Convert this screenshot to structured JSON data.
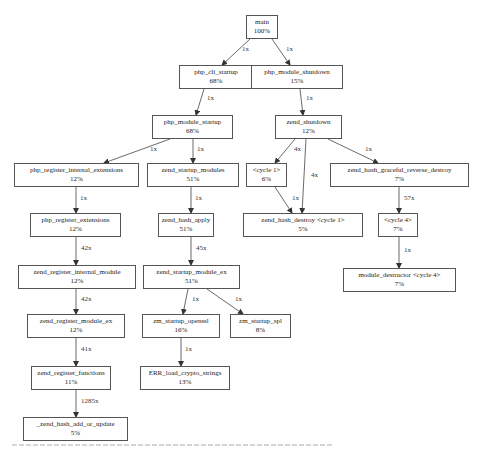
{
  "nodes": [
    {
      "id": "main",
      "name": "main",
      "pct": "100%",
      "x": 246,
      "y": 15,
      "w": 32,
      "h": 24
    },
    {
      "id": "php_cli_startup",
      "name": "php_cli_startup",
      "pct": "68%",
      "x": 179,
      "y": 65,
      "w": 74,
      "h": 24
    },
    {
      "id": "php_module_shutdown",
      "name": "php_module_shutdown",
      "pct": "15%",
      "x": 251,
      "y": 65,
      "w": 92,
      "h": 24
    },
    {
      "id": "php_module_startup",
      "name": "php_module_startup",
      "pct": "68%",
      "x": 152,
      "y": 115,
      "w": 81,
      "h": 24
    },
    {
      "id": "zend_shutdown",
      "name": "zend_shutdown",
      "pct": "12%",
      "x": 275,
      "y": 115,
      "w": 67,
      "h": 24
    },
    {
      "id": "php_register_internal_extensions",
      "name": "php_register_internal_extensions",
      "pct": "12%",
      "x": 14,
      "y": 163,
      "w": 125,
      "h": 24
    },
    {
      "id": "zend_startup_modules",
      "name": "zend_startup_modules",
      "pct": "51%",
      "x": 147,
      "y": 163,
      "w": 92,
      "h": 24
    },
    {
      "id": "cycle1",
      "name": "<cycle 1>",
      "pct": "6%",
      "x": 246,
      "y": 163,
      "w": 41,
      "h": 24
    },
    {
      "id": "zend_hash_graceful_reverse_destroy",
      "name": "zend_hash_graceful_reverse_destroy",
      "pct": "7%",
      "x": 330,
      "y": 163,
      "w": 139,
      "h": 24
    },
    {
      "id": "php_register_extensions",
      "name": "php_register_extensions",
      "pct": "12%",
      "x": 30,
      "y": 213,
      "w": 91,
      "h": 24
    },
    {
      "id": "zend_hash_apply",
      "name": "zend_hash_apply",
      "pct": "51%",
      "x": 158,
      "y": 213,
      "w": 56,
      "h": 24
    },
    {
      "id": "zend_hash_destroy",
      "name": "zend_hash_destroy <cycle 1>",
      "pct": "5%",
      "x": 243,
      "y": 213,
      "w": 120,
      "h": 24
    },
    {
      "id": "cycle4",
      "name": "<cycle 4>",
      "pct": "7%",
      "x": 378,
      "y": 213,
      "w": 40,
      "h": 24
    },
    {
      "id": "zend_register_internal_module",
      "name": "zend_register_internal_module",
      "pct": "12%",
      "x": 18,
      "y": 265,
      "w": 118,
      "h": 24
    },
    {
      "id": "zend_startup_module_ex",
      "name": "zend_startup_module_ex",
      "pct": "51%",
      "x": 143,
      "y": 265,
      "w": 97,
      "h": 24
    },
    {
      "id": "module_destructor",
      "name": "module_destructor <cycle 4>",
      "pct": "7%",
      "x": 343,
      "y": 268,
      "w": 113,
      "h": 24
    },
    {
      "id": "zend_register_module_ex",
      "name": "zend_register_module_ex",
      "pct": "12%",
      "x": 27,
      "y": 314,
      "w": 98,
      "h": 24
    },
    {
      "id": "zm_startup_openssl",
      "name": "zm_startup_openssl",
      "pct": "16%",
      "x": 142,
      "y": 314,
      "w": 78,
      "h": 24
    },
    {
      "id": "zm_startup_spl",
      "name": "zm_startup_spl",
      "pct": "8%",
      "x": 230,
      "y": 314,
      "w": 61,
      "h": 24
    },
    {
      "id": "zend_register_functions",
      "name": "zend_register_functions",
      "pct": "11%",
      "x": 31,
      "y": 366,
      "w": 80,
      "h": 24
    },
    {
      "id": "ERR_load_crypto_strings",
      "name": "ERR_load_crypto_strings",
      "pct": "13%",
      "x": 140,
      "y": 366,
      "w": 90,
      "h": 24
    },
    {
      "id": "_zend_hash_add_or_update",
      "name": "_zend_hash_add_or_update",
      "pct": "5%",
      "x": 23,
      "y": 417,
      "w": 105,
      "h": 24
    }
  ],
  "edges": [
    {
      "from": "main",
      "to": "php_cli_startup",
      "label": "1x",
      "x1": 250,
      "y1": 39,
      "x2": 222,
      "y2": 65,
      "lx": 242,
      "ly": 49
    },
    {
      "from": "main",
      "to": "php_module_shutdown",
      "label": "1x",
      "x1": 272,
      "y1": 39,
      "x2": 290,
      "y2": 65,
      "lx": 286,
      "ly": 49
    },
    {
      "from": "php_cli_startup",
      "to": "php_module_startup",
      "label": "1x",
      "x1": 204,
      "y1": 89,
      "x2": 196,
      "y2": 115,
      "lx": 207,
      "ly": 98
    },
    {
      "from": "php_module_shutdown",
      "to": "zend_shutdown",
      "label": "1x",
      "x1": 300,
      "y1": 89,
      "x2": 303,
      "y2": 115,
      "lx": 306,
      "ly": 98
    },
    {
      "from": "php_module_startup",
      "to": "php_register_internal_extensions",
      "label": "1x",
      "x1": 170,
      "y1": 139,
      "x2": 104,
      "y2": 163,
      "lx": 150,
      "ly": 149
    },
    {
      "from": "php_module_startup",
      "to": "zend_startup_modules",
      "label": "1x",
      "x1": 193,
      "y1": 139,
      "x2": 193,
      "y2": 163,
      "lx": 197,
      "ly": 149
    },
    {
      "from": "zend_shutdown",
      "to": "cycle1",
      "label": "4x",
      "x1": 295,
      "y1": 139,
      "x2": 275,
      "y2": 163,
      "lx": 294,
      "ly": 149
    },
    {
      "from": "zend_shutdown",
      "to": "zend_hash_destroy",
      "label": "4x",
      "x1": 306,
      "y1": 139,
      "x2": 302,
      "y2": 213,
      "lx": 311,
      "ly": 175
    },
    {
      "from": "zend_shutdown",
      "to": "zend_hash_graceful_reverse_destroy",
      "label": "1x",
      "x1": 328,
      "y1": 139,
      "x2": 378,
      "y2": 163,
      "lx": 365,
      "ly": 149
    },
    {
      "from": "php_register_internal_extensions",
      "to": "php_register_extensions",
      "label": "1x",
      "x1": 76,
      "y1": 187,
      "x2": 76,
      "y2": 213,
      "lx": 80,
      "ly": 198
    },
    {
      "from": "zend_startup_modules",
      "to": "zend_hash_apply",
      "label": "1x",
      "x1": 191,
      "y1": 187,
      "x2": 191,
      "y2": 213,
      "lx": 195,
      "ly": 198
    },
    {
      "from": "cycle1",
      "to": "zend_hash_destroy",
      "label": "1x",
      "x1": 275,
      "y1": 187,
      "x2": 292,
      "y2": 213,
      "lx": 292,
      "ly": 198
    },
    {
      "from": "zend_hash_graceful_reverse_destroy",
      "to": "cycle4",
      "label": "57x",
      "x1": 399,
      "y1": 187,
      "x2": 399,
      "y2": 213,
      "lx": 404,
      "ly": 198
    },
    {
      "from": "php_register_extensions",
      "to": "zend_register_internal_module",
      "label": "42x",
      "x1": 76,
      "y1": 237,
      "x2": 76,
      "y2": 265,
      "lx": 81,
      "ly": 248
    },
    {
      "from": "zend_hash_apply",
      "to": "zend_startup_module_ex",
      "label": "45x",
      "x1": 191,
      "y1": 237,
      "x2": 191,
      "y2": 265,
      "lx": 196,
      "ly": 248
    },
    {
      "from": "cycle4",
      "to": "module_destructor",
      "label": "1x",
      "x1": 399,
      "y1": 237,
      "x2": 399,
      "y2": 268,
      "lx": 404,
      "ly": 250
    },
    {
      "from": "zend_register_internal_module",
      "to": "zend_register_module_ex",
      "label": "42x",
      "x1": 76,
      "y1": 289,
      "x2": 76,
      "y2": 314,
      "lx": 81,
      "ly": 299
    },
    {
      "from": "zend_startup_module_ex",
      "to": "zm_startup_openssl",
      "label": "1x",
      "x1": 188,
      "y1": 289,
      "x2": 183,
      "y2": 314,
      "lx": 192,
      "ly": 299
    },
    {
      "from": "zend_startup_module_ex",
      "to": "zm_startup_spl",
      "label": "1x",
      "x1": 207,
      "y1": 289,
      "x2": 243,
      "y2": 314,
      "lx": 235,
      "ly": 299
    },
    {
      "from": "zend_register_module_ex",
      "to": "zend_register_functions",
      "label": "41x",
      "x1": 76,
      "y1": 338,
      "x2": 76,
      "y2": 366,
      "lx": 81,
      "ly": 349
    },
    {
      "from": "zm_startup_openssl",
      "to": "ERR_load_crypto_strings",
      "label": "1x",
      "x1": 181,
      "y1": 338,
      "x2": 181,
      "y2": 366,
      "lx": 185,
      "ly": 349
    },
    {
      "from": "zend_register_functions",
      "to": "_zend_hash_add_or_update",
      "label": "1285x",
      "x1": 76,
      "y1": 390,
      "x2": 76,
      "y2": 417,
      "lx": 81,
      "ly": 401
    }
  ],
  "colors": {
    "border": "#555555",
    "edge": "#444444",
    "text": "#222222",
    "background": "#ffffff"
  }
}
